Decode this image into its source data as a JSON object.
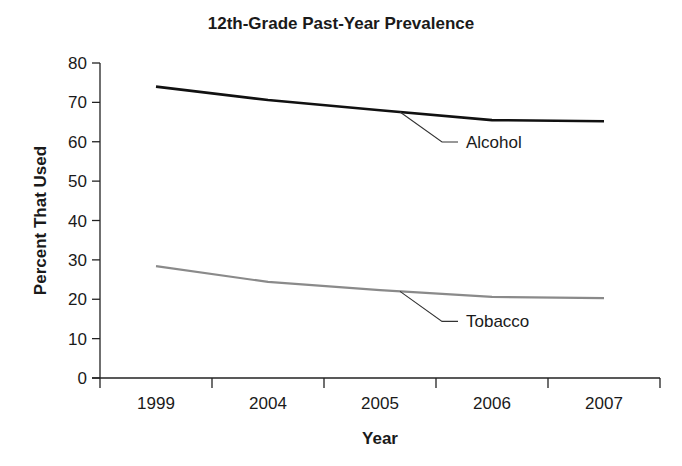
{
  "chart_data": {
    "type": "line",
    "title": "12th-Grade Past-Year Prevalence",
    "xlabel": "Year",
    "ylabel": "Percent That Used",
    "categories": [
      "1999",
      "2004",
      "2005",
      "2006",
      "2007"
    ],
    "ylim": [
      0,
      80
    ],
    "yticks": [
      0,
      10,
      20,
      30,
      40,
      50,
      60,
      70,
      80
    ],
    "grid": false,
    "legend_position": "inline-callouts",
    "series": [
      {
        "name": "Alcohol",
        "color": "#111111",
        "values": [
          74.0,
          70.6,
          68.0,
          65.5,
          65.2
        ]
      },
      {
        "name": "Tobacco",
        "color": "#8a8a8a",
        "values": [
          28.4,
          24.4,
          22.3,
          20.6,
          20.3
        ]
      }
    ]
  }
}
